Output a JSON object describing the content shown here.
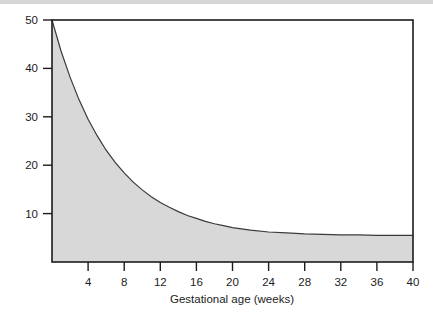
{
  "figure": {
    "name": "gestational-age-decay-chart",
    "background_color": "#ffffff",
    "top_strip_color": "#d6d6d6"
  },
  "chart_data": {
    "type": "area",
    "title": "",
    "subtitle": "",
    "xlabel": "Gestational age (weeks)",
    "ylabel": "",
    "xlim": [
      0,
      40
    ],
    "ylim": [
      0,
      50
    ],
    "grid": false,
    "legend": false,
    "legend_position": "none",
    "line_color": "#3a3a3a",
    "fill_color": "#d8d8d8",
    "frame_color": "#1c1c1c",
    "xticks": [
      4,
      8,
      12,
      16,
      20,
      24,
      28,
      32,
      36,
      40
    ],
    "xtick_labels": [
      "4",
      "8",
      "12",
      "16",
      "20",
      "24",
      "28",
      "32",
      "36",
      "40"
    ],
    "yticks": [
      10,
      20,
      30,
      40,
      50
    ],
    "ytick_labels": [
      "10",
      "20",
      "30",
      "40",
      "50"
    ],
    "series": [
      {
        "name": "risk",
        "x": [
          0,
          1,
          2,
          3,
          4,
          5,
          6,
          7,
          8,
          9,
          10,
          11,
          12,
          13,
          14,
          15,
          16,
          17,
          18,
          19,
          20,
          22,
          24,
          26,
          28,
          30,
          32,
          34,
          36,
          38,
          40
        ],
        "values": [
          50.0,
          43.6,
          38.2,
          33.5,
          29.5,
          26.1,
          23.1,
          20.6,
          18.4,
          16.5,
          14.9,
          13.5,
          12.3,
          11.3,
          10.4,
          9.6,
          9.0,
          8.4,
          7.9,
          7.5,
          7.1,
          6.6,
          6.2,
          6.0,
          5.8,
          5.7,
          5.6,
          5.6,
          5.5,
          5.5,
          5.5
        ]
      }
    ],
    "annotations": []
  }
}
